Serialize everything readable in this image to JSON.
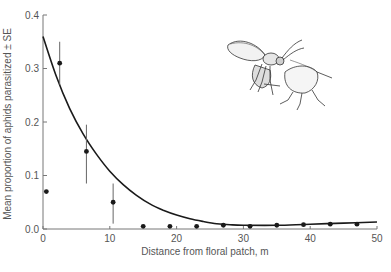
{
  "chart_data": {
    "type": "scatter",
    "title": "",
    "xlabel": "Distance from floral patch, m",
    "ylabel": "Mean proportion of aphids parasitized ± SE",
    "xlim": [
      0,
      50
    ],
    "ylim": [
      0.0,
      0.4
    ],
    "x_ticks": [
      0,
      10,
      20,
      30,
      40,
      50
    ],
    "x_tick_labels": [
      "0",
      "10",
      "20",
      "30",
      "40",
      "50"
    ],
    "y_ticks": [
      0.0,
      0.1,
      0.2,
      0.3,
      0.4
    ],
    "y_tick_labels": [
      "0.0",
      "0.1",
      "0.2",
      "0.3",
      "0.4"
    ],
    "grid": false,
    "legend": null,
    "series": [
      {
        "name": "Observed mean proportion parasitized",
        "kind": "points_with_error_bars",
        "points": [
          {
            "x": 0.5,
            "y": 0.07,
            "se_low": null,
            "se_high": null
          },
          {
            "x": 2.5,
            "y": 0.31,
            "se_low": 0.27,
            "se_high": 0.35
          },
          {
            "x": 6.5,
            "y": 0.145,
            "se_low": 0.085,
            "se_high": 0.195
          },
          {
            "x": 10.5,
            "y": 0.05,
            "se_low": 0.01,
            "se_high": 0.085
          },
          {
            "x": 15,
            "y": 0.005,
            "se_low": null,
            "se_high": null
          },
          {
            "x": 19,
            "y": 0.005,
            "se_low": null,
            "se_high": null
          },
          {
            "x": 23,
            "y": 0.005,
            "se_low": null,
            "se_high": null
          },
          {
            "x": 27,
            "y": 0.007,
            "se_low": null,
            "se_high": null
          },
          {
            "x": 31,
            "y": 0.005,
            "se_low": null,
            "se_high": null
          },
          {
            "x": 35,
            "y": 0.007,
            "se_low": null,
            "se_high": null
          },
          {
            "x": 39,
            "y": 0.008,
            "se_low": null,
            "se_high": null
          },
          {
            "x": 43,
            "y": 0.009,
            "se_low": null,
            "se_high": null
          },
          {
            "x": 47,
            "y": 0.009,
            "se_low": null,
            "se_high": null
          }
        ]
      },
      {
        "name": "Fitted curve",
        "kind": "line",
        "x": [
          0,
          2,
          4,
          6,
          8,
          10,
          12,
          14,
          16,
          18,
          20,
          22,
          24,
          26,
          28,
          30,
          35,
          40,
          45,
          50
        ],
        "y": [
          0.36,
          0.285,
          0.225,
          0.178,
          0.14,
          0.108,
          0.083,
          0.063,
          0.047,
          0.035,
          0.026,
          0.019,
          0.014,
          0.01,
          0.008,
          0.007,
          0.007,
          0.009,
          0.011,
          0.013
        ]
      }
    ],
    "annotations": [
      {
        "type": "illustration",
        "description": "Line drawing of a parasitoid wasp ovipositing into an aphid",
        "position": "upper right"
      }
    ]
  },
  "axes": {
    "x_title": "Distance from floral patch, m",
    "y_title": "Mean proportion of aphids parasitized ± SE"
  },
  "colors": {
    "ink": "#1a1a1a",
    "axis": "#777777",
    "error_bar": "#666666",
    "text": "#555555",
    "background": "#ffffff"
  }
}
